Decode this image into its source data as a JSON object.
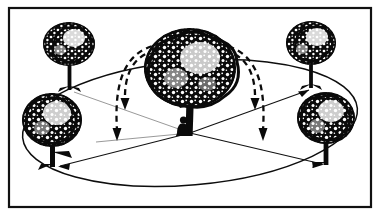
{
  "figure": {
    "title": "Seed dispersal from a central tree",
    "style": "black and white ink illustration",
    "background_color": "#ffffff",
    "ink_color": "#0a0a0a",
    "frame": {
      "name": "outer border",
      "stroke_color": "#111111",
      "stroke_width": 2.2,
      "x": 9,
      "y": 8,
      "width": 362,
      "height": 199
    },
    "ground": {
      "name": "ground ellipse",
      "center_x": 190,
      "center_y": 123,
      "radius_x": 168,
      "radius_y": 62,
      "rotation_deg": -5,
      "stroke_color": "#0d0d0d"
    },
    "center_point": {
      "x": 190,
      "y": 133
    },
    "trees": [
      {
        "id": "center-tree",
        "label": "central tree",
        "position": "center",
        "trunk_x": 190,
        "base_y": 134,
        "trunk_top_y": 92,
        "trunk_width": 8,
        "crown_cx": 190,
        "crown_cy": 68,
        "crown_rx": 46,
        "crown_ry": 40,
        "size": "large"
      },
      {
        "id": "tree-upper-left",
        "label": "upper left tree",
        "position": "upper-left",
        "trunk_x": 70,
        "base_y": 90,
        "trunk_top_y": 58,
        "trunk_width": 4,
        "crown_cx": 69,
        "crown_cy": 44,
        "crown_rx": 26,
        "crown_ry": 22,
        "size": "medium"
      },
      {
        "id": "tree-upper-right",
        "label": "upper right tree",
        "position": "upper-right",
        "trunk_x": 311,
        "base_y": 88,
        "trunk_top_y": 56,
        "trunk_width": 4,
        "crown_cx": 311,
        "crown_cy": 43,
        "crown_rx": 25,
        "crown_ry": 22,
        "size": "medium"
      },
      {
        "id": "tree-lower-left",
        "label": "lower left tree",
        "position": "lower-left",
        "trunk_x": 53,
        "base_y": 166,
        "trunk_top_y": 128,
        "trunk_width": 5,
        "crown_cx": 52,
        "crown_cy": 120,
        "crown_rx": 30,
        "crown_ry": 27,
        "size": "large"
      },
      {
        "id": "tree-lower-right",
        "label": "lower right tree",
        "position": "lower-right",
        "trunk_x": 326,
        "base_y": 163,
        "trunk_top_y": 126,
        "trunk_width": 5,
        "crown_cx": 326,
        "crown_cy": 118,
        "crown_rx": 29,
        "crown_ry": 26,
        "size": "large"
      }
    ],
    "radial_arrows": [
      {
        "id": "radial-upper-left",
        "label": "radial line to upper left tree",
        "from_x": 190,
        "from_y": 133,
        "to_x": 74,
        "to_y": 90,
        "arrowhead": false,
        "tone": "faint"
      },
      {
        "id": "radial-upper-right",
        "label": "radial arrow to upper right tree",
        "from_x": 190,
        "from_y": 133,
        "to_x": 307,
        "to_y": 89,
        "arrowhead": true,
        "tone": "solid"
      },
      {
        "id": "radial-lower-left",
        "label": "radial arrow to lower left tree",
        "from_x": 190,
        "from_y": 133,
        "to_x": 58,
        "to_y": 166,
        "arrowhead": true,
        "tone": "solid"
      },
      {
        "id": "radial-lower-right",
        "label": "radial arrow to lower right tree",
        "from_x": 190,
        "from_y": 133,
        "to_x": 322,
        "to_y": 164,
        "arrowhead": true,
        "tone": "solid"
      }
    ],
    "dashed_arcs": [
      {
        "id": "arc-left-inner",
        "label": "inner dashed trajectory falling left",
        "start_x": 176,
        "start_y": 48,
        "control_x": 128,
        "control_y": 52,
        "end_x": 125,
        "end_y": 103,
        "arrowhead_x": 125,
        "arrowhead_y": 107,
        "direction": "down"
      },
      {
        "id": "arc-left-outer",
        "label": "outer dashed trajectory falling left",
        "start_x": 182,
        "start_y": 42,
        "control_x": 112,
        "control_y": 50,
        "end_x": 118,
        "end_y": 133,
        "arrowhead_x": 118,
        "arrowhead_y": 138,
        "direction": "down"
      },
      {
        "id": "arc-right-inner",
        "label": "inner dashed trajectory falling right",
        "start_x": 203,
        "start_y": 48,
        "control_x": 252,
        "control_y": 52,
        "end_x": 255,
        "end_y": 103,
        "arrowhead_x": 255,
        "arrowhead_y": 107,
        "direction": "down"
      },
      {
        "id": "arc-right-outer",
        "label": "outer dashed trajectory falling right",
        "start_x": 197,
        "start_y": 42,
        "control_x": 268,
        "control_y": 50,
        "end_x": 262,
        "end_y": 133,
        "arrowhead_x": 262,
        "arrowhead_y": 138,
        "direction": "down"
      }
    ],
    "person": {
      "id": "person-figure",
      "label": "crouching person at tree base",
      "x": 178,
      "y": 118,
      "width": 13,
      "height": 17
    }
  }
}
